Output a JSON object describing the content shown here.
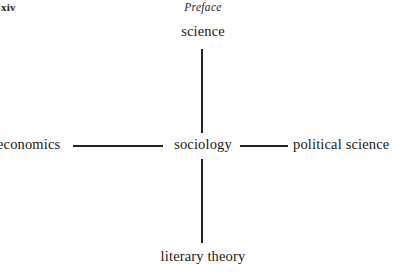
{
  "page": {
    "folio": "xiv",
    "running_head": "Preface",
    "background_color": "#ffffff",
    "text_color": "#1c1a18"
  },
  "diagram": {
    "type": "cross-node-diagram",
    "center_node": "sociology",
    "nodes": {
      "top": "science",
      "left": "economics",
      "center": "sociology",
      "right": "political science",
      "bottom": "literary theory"
    },
    "connectors": [
      {
        "name": "science-to-sociology",
        "orientation": "vertical"
      },
      {
        "name": "economics-to-sociology",
        "orientation": "horizontal"
      },
      {
        "name": "sociology-to-political-science",
        "orientation": "horizontal"
      },
      {
        "name": "sociology-to-literary-theory",
        "orientation": "vertical"
      }
    ],
    "line_color": "#26221f"
  }
}
